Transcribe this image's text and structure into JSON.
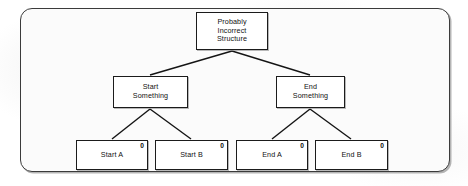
{
  "diagram": {
    "type": "hierarchy-tree",
    "frame": {
      "shape": "rounded-rectangle"
    },
    "root": {
      "id": "root",
      "label": "Probably\nIncorrect\nStructure",
      "x": 196,
      "y": 12,
      "w": 72,
      "h": 38
    },
    "branches": [
      {
        "id": "start-something",
        "label": "Start\nSomething",
        "x": 113,
        "y": 76,
        "w": 75,
        "h": 32
      },
      {
        "id": "end-something",
        "label": "End\nSomething",
        "x": 276,
        "y": 76,
        "w": 69,
        "h": 32
      }
    ],
    "leaves": [
      {
        "id": "start-a",
        "label": "Start A",
        "badge": "0",
        "parent": "start-something",
        "x": 76,
        "y": 140,
        "w": 72,
        "h": 30
      },
      {
        "id": "start-b",
        "label": "Start B",
        "badge": "0",
        "parent": "start-something",
        "x": 155,
        "y": 140,
        "w": 73,
        "h": 30
      },
      {
        "id": "end-a",
        "label": "End A",
        "badge": "0",
        "parent": "end-something",
        "x": 236,
        "y": 140,
        "w": 72,
        "h": 30
      },
      {
        "id": "end-b",
        "label": "End B",
        "badge": "0",
        "parent": "end-something",
        "x": 315,
        "y": 140,
        "w": 73,
        "h": 30
      }
    ],
    "colors": {
      "line": "#141414",
      "node_border": "#1b1b1b",
      "frame_border": "#3b3b3b",
      "node_fill": "#ffffff",
      "page": "#ffffff"
    }
  }
}
